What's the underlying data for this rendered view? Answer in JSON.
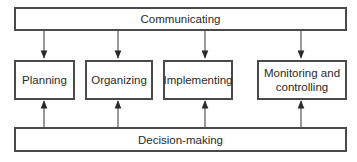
{
  "diagram": {
    "top_bar": {
      "label": "Communicating"
    },
    "bottom_bar": {
      "label": "Decision-making"
    },
    "functions": [
      {
        "label": "Planning"
      },
      {
        "label": "Organizing"
      },
      {
        "label": "Implementing"
      },
      {
        "label": "Monitoring and\ncontrolling"
      }
    ],
    "edges": [
      {
        "from": "Communicating",
        "to": "Planning"
      },
      {
        "from": "Communicating",
        "to": "Organizing"
      },
      {
        "from": "Communicating",
        "to": "Implementing"
      },
      {
        "from": "Communicating",
        "to": "Monitoring and controlling"
      },
      {
        "from": "Decision-making",
        "to": "Planning"
      },
      {
        "from": "Decision-making",
        "to": "Organizing"
      },
      {
        "from": "Decision-making",
        "to": "Implementing"
      },
      {
        "from": "Decision-making",
        "to": "Monitoring and controlling"
      }
    ]
  }
}
